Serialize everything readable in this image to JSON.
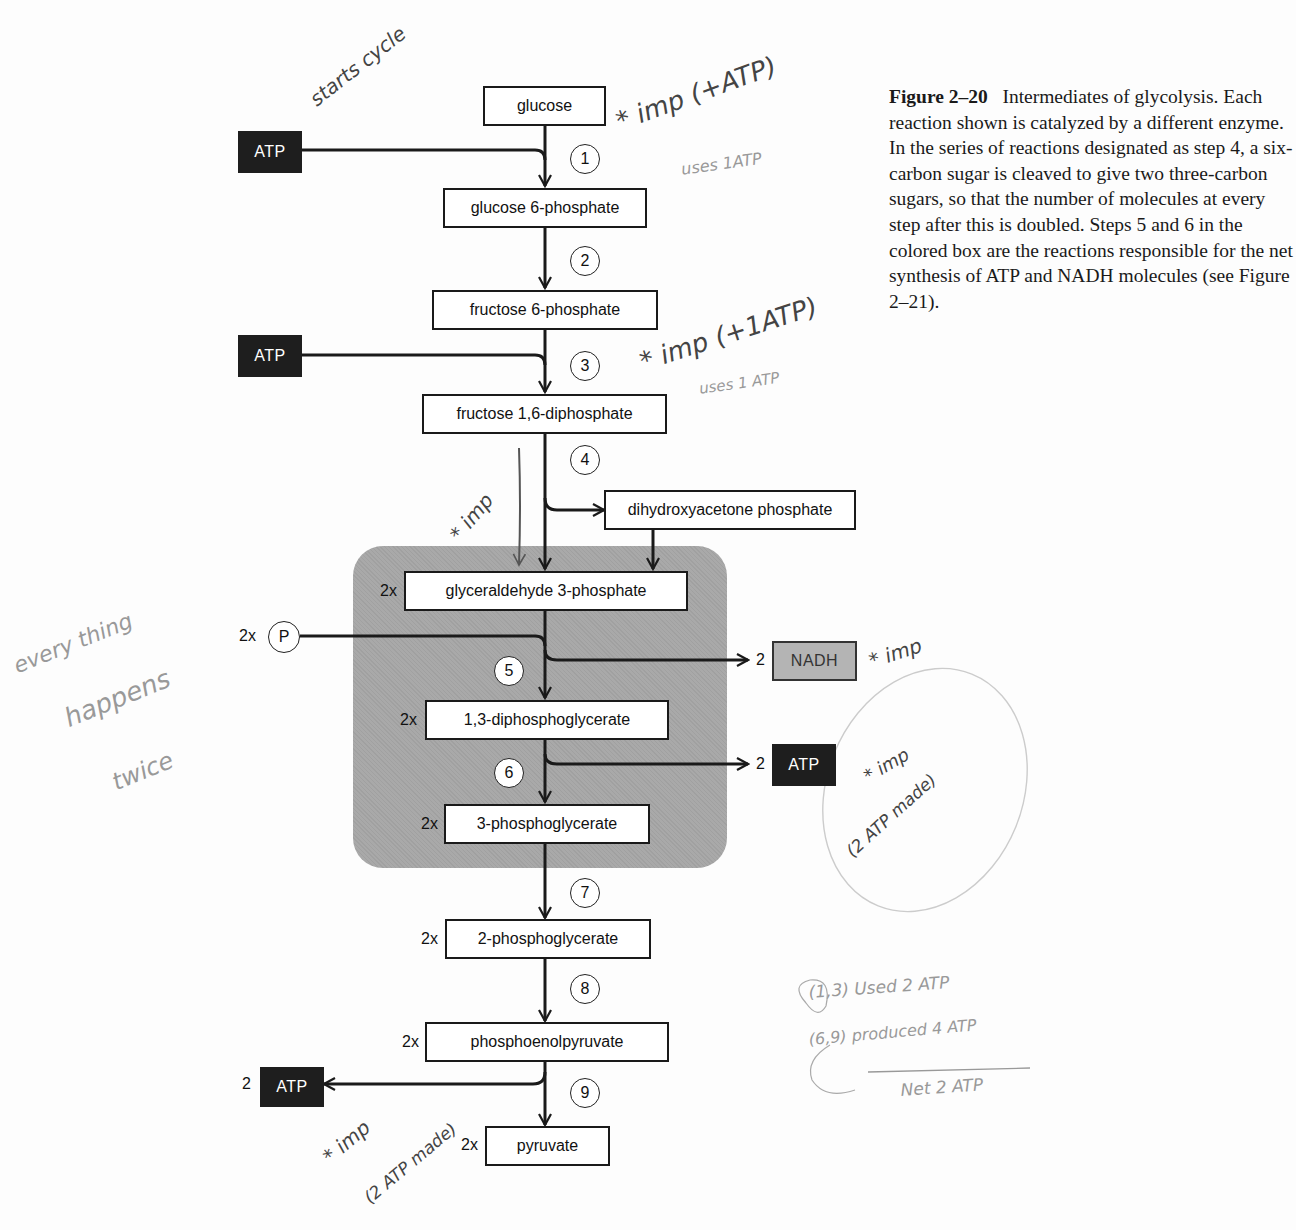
{
  "figure": {
    "number": "Figure 2–20",
    "caption": "Intermediates of glycolysis. Each reaction shown is catalyzed by a different enzyme. In the series of reactions designated as step 4, a six-carbon sugar is cleaved to give two three-carbon sugars, so that the number of molecules at every step after this is doubled. Steps 5 and 6 in the colored box are the reactions responsible for the net synthesis of ATP and NADH molecules (see Figure 2–21)."
  },
  "intermediates": [
    {
      "id": "glucose",
      "label": "glucose",
      "multiplier": ""
    },
    {
      "id": "glucose-6-phosphate",
      "label": "glucose 6-phosphate",
      "multiplier": ""
    },
    {
      "id": "fructose-6-phosphate",
      "label": "fructose 6-phosphate",
      "multiplier": ""
    },
    {
      "id": "fructose-1-6-diphosphate",
      "label": "fructose 1,6-diphosphate",
      "multiplier": ""
    },
    {
      "id": "dihydroxyacetone-phosphate",
      "label": "dihydroxyacetone phosphate",
      "multiplier": ""
    },
    {
      "id": "glyceraldehyde-3-phosphate",
      "label": "glyceraldehyde 3-phosphate",
      "multiplier": "2x"
    },
    {
      "id": "1-3-diphosphoglycerate",
      "label": "1,3-diphosphoglycerate",
      "multiplier": "2x"
    },
    {
      "id": "3-phosphoglycerate",
      "label": "3-phosphoglycerate",
      "multiplier": "2x"
    },
    {
      "id": "2-phosphoglycerate",
      "label": "2-phosphoglycerate",
      "multiplier": "2x"
    },
    {
      "id": "phosphoenolpyruvate",
      "label": "phosphoenolpyruvate",
      "multiplier": "2x"
    },
    {
      "id": "pyruvate",
      "label": "pyruvate",
      "multiplier": "2x"
    }
  ],
  "steps": [
    "1",
    "2",
    "3",
    "4",
    "5",
    "6",
    "7",
    "8",
    "9"
  ],
  "cofactors": {
    "atp_in_1": {
      "label": "ATP",
      "count": ""
    },
    "atp_in_3": {
      "label": "ATP",
      "count": ""
    },
    "phosphate_in_5": {
      "label": "P",
      "count": "2x"
    },
    "nadh_out_5": {
      "label": "NADH",
      "count": "2"
    },
    "atp_out_6": {
      "label": "ATP",
      "count": "2"
    },
    "atp_out_9": {
      "label": "ATP",
      "count": "2"
    }
  },
  "colors": {
    "shaded_box": "#a9a9a9",
    "atp_box": "#1e1e1e",
    "nadh_box": "#b4b4b4",
    "line": "#1a1a1a"
  },
  "handwritten_notes": {
    "atp_in_1_note": "starts cycle",
    "step1_note": "* imp (+ATP)",
    "step1_subnote": "uses 1ATP",
    "step3_note": "* imp (+1ATP)",
    "step3_subnote": "uses 1 ATP",
    "step4_note": "* imp",
    "left_margin": [
      "every thing",
      "happens",
      "twice"
    ],
    "nadh_note": "* imp",
    "atp6_note": "* imp",
    "atp6_subnote": "(2 ATP made)",
    "atp9_note": "* imp",
    "atp9_subnote": "(2 ATP made)",
    "summary": [
      "(1,3) Used 2 ATP",
      "(6,9) produced 4 ATP",
      "Net 2 ATP"
    ]
  }
}
